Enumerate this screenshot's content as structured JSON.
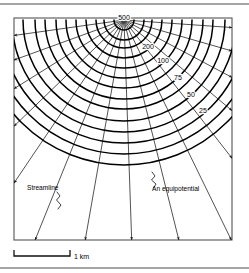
{
  "figure": {
    "colors": {
      "background": "#ffffff",
      "frame_stroke": "#555555",
      "streamline_stroke": "#1a1a1a",
      "equipotential_stroke": "#000000",
      "rule_stroke": "#4a4a4a",
      "text": "#000000"
    }
  },
  "source": {
    "label": "500",
    "x": 124,
    "y": 20
  },
  "equipotentials": [
    {
      "label": "500",
      "radius": 10,
      "label_x": 124,
      "label_y": 20,
      "anchor": "middle"
    },
    {
      "label": "200",
      "radius": 38,
      "label_x": 148,
      "label_y": 49,
      "anchor": "middle"
    },
    {
      "label": "100",
      "radius": 58,
      "label_x": 163,
      "label_y": 63,
      "anchor": "middle"
    },
    {
      "label": "75",
      "radius": 79,
      "label_x": 178,
      "label_y": 80,
      "anchor": "middle"
    },
    {
      "label": "50",
      "radius": 101,
      "label_x": 191,
      "label_y": 97,
      "anchor": "middle"
    },
    {
      "label": "25",
      "radius": 123,
      "label_x": 203,
      "label_y": 113,
      "anchor": "middle"
    }
  ],
  "unlabeled_equipotentials": [
    20,
    28,
    48,
    68,
    89,
    112,
    134,
    145
  ],
  "streamline_angles_deg": [
    4,
    16,
    28,
    40,
    52,
    64,
    76,
    88,
    100,
    112,
    124,
    136,
    148,
    160,
    172
  ],
  "annotations": [
    {
      "name": "streamline",
      "text": "Streamline",
      "x": 27,
      "y": 190
    },
    {
      "name": "equipotential",
      "text": "An equipotential",
      "x": 152,
      "y": 191
    }
  ],
  "scale": {
    "label": "1 km",
    "bar_start_x": 14,
    "bar_end_x": 70,
    "bar_y": 256,
    "tick_height": 6,
    "label_x": 74,
    "label_y": 259
  },
  "plot_frame": {
    "x": 14,
    "y": 18,
    "width": 218,
    "height": 222
  },
  "rules": [
    {
      "name": "top-rule",
      "y": 4
    },
    {
      "name": "bottom-rule",
      "y": 268
    }
  ]
}
